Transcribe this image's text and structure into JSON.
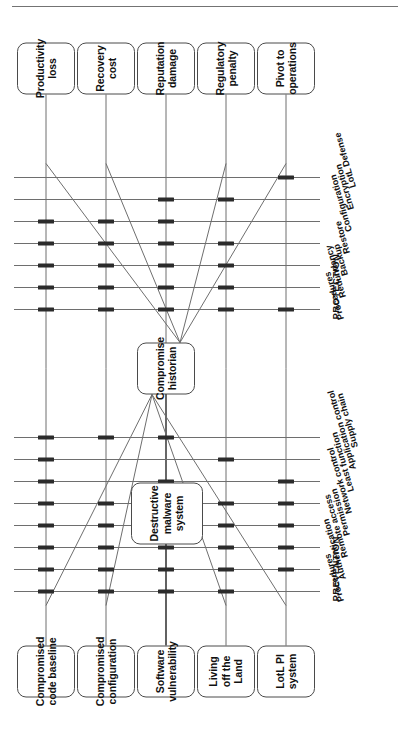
{
  "figure": {
    "type": "bow-tie-risk-diagram",
    "orientation": "rotated-90-ccw",
    "center_event": {
      "label": "Compromise historian"
    },
    "secondary_event": {
      "label": "Destructive malware system"
    },
    "sections": {
      "prevention": {
        "label": "PREVENTION"
      },
      "protection": {
        "label": "PROTECTION"
      }
    }
  },
  "threats": [
    {
      "id": "t1",
      "label": "Compromised code baseline"
    },
    {
      "id": "t2",
      "label": "Compromised configuration"
    },
    {
      "id": "t3",
      "label": "Software vulnerability"
    },
    {
      "id": "t4",
      "label": "Living off the Land"
    },
    {
      "id": "t5",
      "label": "LotL PI system"
    }
  ],
  "consequences": [
    {
      "id": "c1",
      "label": "Productivity loss"
    },
    {
      "id": "c2",
      "label": "Recovery cost"
    },
    {
      "id": "c3",
      "label": "Reputation damage"
    },
    {
      "id": "c4",
      "label": "Regulatory penalty"
    },
    {
      "id": "c5",
      "label": "Pivot to operations"
    }
  ],
  "prevention_barriers": [
    {
      "id": "p1",
      "label": "Procedures"
    },
    {
      "id": "p2",
      "label": "Authentication"
    },
    {
      "id": "p3",
      "label": "Remote access"
    },
    {
      "id": "p4",
      "label": "Permission"
    },
    {
      "id": "p5",
      "label": "Network control"
    },
    {
      "id": "p6",
      "label": "Least function"
    },
    {
      "id": "p7",
      "label": "Application control"
    },
    {
      "id": "p8",
      "label": "Supply chain"
    }
  ],
  "protection_barriers": [
    {
      "id": "r1",
      "label": "Procedures"
    },
    {
      "id": "r2",
      "label": "Redundancy"
    },
    {
      "id": "r3",
      "label": "Backup"
    },
    {
      "id": "r4",
      "label": "Restore"
    },
    {
      "id": "r5",
      "label": "Configuration"
    },
    {
      "id": "r6",
      "label": "Encryption"
    },
    {
      "id": "r7",
      "label": "LotL Defense"
    }
  ],
  "prevention_matrix": [
    {
      "threat": "t1",
      "barriers": [
        "p1",
        "p2",
        "p3",
        "p4",
        "p5",
        "p6",
        "p7",
        "p8"
      ]
    },
    {
      "threat": "t2",
      "barriers": [
        "p1",
        "p2",
        "p3",
        "p4",
        "p5",
        "p8"
      ]
    },
    {
      "threat": "t3",
      "barriers": [
        "p1",
        "p2",
        "p3",
        "p4",
        "p5",
        "p6",
        "p8"
      ]
    },
    {
      "threat": "t4",
      "barriers": [
        "p1",
        "p2",
        "p3",
        "p4",
        "p5",
        "p7"
      ]
    },
    {
      "threat": "t5",
      "barriers": [
        "p2",
        "p3",
        "p4",
        "p5",
        "p6"
      ]
    }
  ],
  "protection_matrix": [
    {
      "consequence": "c1",
      "barriers": [
        "r1",
        "r2",
        "r3",
        "r4",
        "r5"
      ]
    },
    {
      "consequence": "c2",
      "barriers": [
        "r1",
        "r2",
        "r3",
        "r4",
        "r5"
      ]
    },
    {
      "consequence": "c3",
      "barriers": [
        "r1",
        "r2",
        "r3",
        "r4",
        "r5",
        "r6"
      ]
    },
    {
      "consequence": "c4",
      "barriers": [
        "r1",
        "r2",
        "r3",
        "r4",
        "r6"
      ]
    },
    {
      "consequence": "c5",
      "barriers": [
        "r1",
        "r7"
      ]
    }
  ],
  "colors": {
    "line": "#6e6e6e",
    "tick": "#2b2b2b",
    "box_border": "#4a4a4a",
    "text": "#111111",
    "background": "#ffffff"
  }
}
